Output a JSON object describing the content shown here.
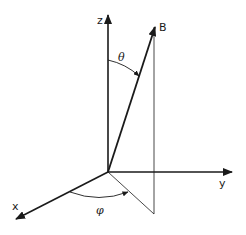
{
  "diagram": {
    "type": "3d-coordinate-system",
    "axes": [
      {
        "name": "z",
        "label": "z"
      },
      {
        "name": "y",
        "label": "y"
      },
      {
        "name": "x",
        "label": "x"
      }
    ],
    "vector": {
      "label": "B"
    },
    "angles": [
      {
        "name": "theta",
        "label": "θ",
        "description": "polar angle between z-axis and B"
      },
      {
        "name": "phi",
        "label": "φ",
        "description": "azimuthal angle between x-axis and projection of B"
      }
    ],
    "colors": {
      "line": "#1a1a1a",
      "background": "#ffffff"
    }
  }
}
